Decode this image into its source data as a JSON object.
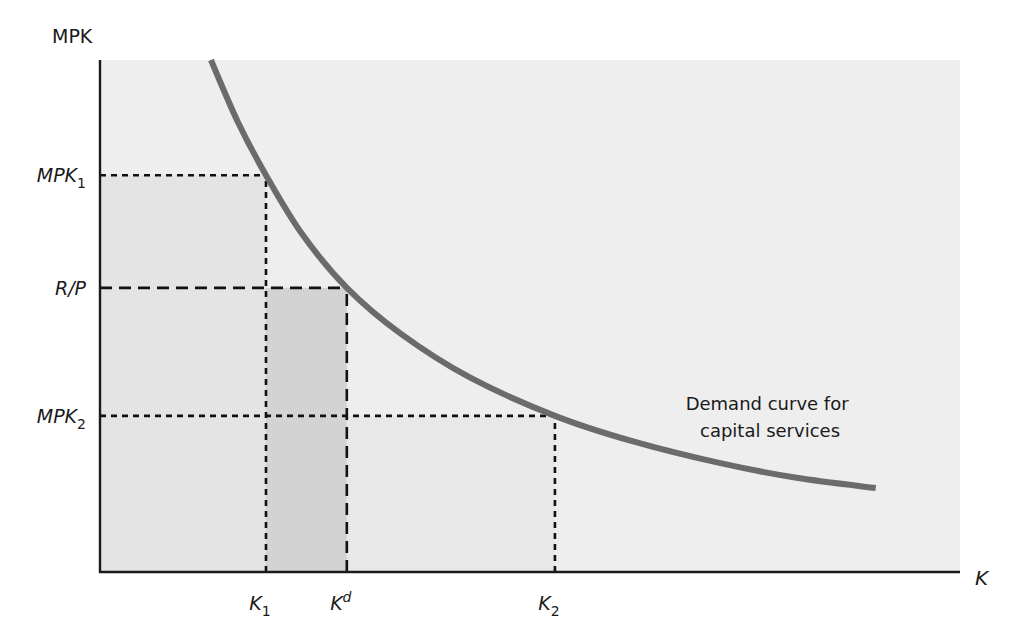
{
  "chart_data": {
    "type": "line",
    "title": "",
    "xlabel": "K",
    "ylabel": "MPK",
    "xlim": [
      0,
      100
    ],
    "ylim": [
      0,
      100
    ],
    "grid": false,
    "series": [
      {
        "name": "Demand curve for capital services",
        "label_lines": [
          "Demand curve for",
          "capital services"
        ],
        "color": "#6b6b6b",
        "points": [
          [
            12.9,
            100
          ],
          [
            16.0,
            88.0
          ],
          [
            19.3,
            77.5
          ],
          [
            23.5,
            66.0
          ],
          [
            28.7,
            55.5
          ],
          [
            35.0,
            46.5
          ],
          [
            43.0,
            38.0
          ],
          [
            52.9,
            30.5
          ],
          [
            62.0,
            25.5
          ],
          [
            72.0,
            21.3
          ],
          [
            81.0,
            18.4
          ],
          [
            90.2,
            16.4
          ]
        ]
      }
    ],
    "x_ticks": [
      {
        "name": "K1",
        "base": "K",
        "sub": "1",
        "sup": "",
        "value": 19.3
      },
      {
        "name": "Kd",
        "base": "K",
        "sub": "",
        "sup": "d",
        "value": 28.7
      },
      {
        "name": "K2",
        "base": "K",
        "sub": "2",
        "sup": "",
        "value": 52.9
      }
    ],
    "y_ticks": [
      {
        "name": "MPK1",
        "base": "MPK",
        "sub": "1",
        "value": 77.5
      },
      {
        "name": "R/P",
        "base": "R/P",
        "sub": "",
        "value": 55.5
      },
      {
        "name": "MPK2",
        "base": "MPK",
        "sub": "2",
        "value": 30.5
      }
    ],
    "reference_lines": [
      {
        "name": "mpk1-horizontal",
        "from": [
          0,
          77.5
        ],
        "to": [
          19.3,
          77.5
        ],
        "style": "dotted"
      },
      {
        "name": "k1-vertical",
        "from": [
          19.3,
          0
        ],
        "to": [
          19.3,
          77.5
        ],
        "style": "dotted"
      },
      {
        "name": "rp-horizontal",
        "from": [
          0,
          55.5
        ],
        "to": [
          28.7,
          55.5
        ],
        "style": "dashed"
      },
      {
        "name": "kd-vertical",
        "from": [
          28.7,
          0
        ],
        "to": [
          28.7,
          55.5
        ],
        "style": "dashed"
      },
      {
        "name": "mpk2-horizontal",
        "from": [
          0,
          30.5
        ],
        "to": [
          52.9,
          30.5
        ],
        "style": "dotted"
      },
      {
        "name": "k2-vertical",
        "from": [
          52.9,
          0
        ],
        "to": [
          52.9,
          30.5
        ],
        "style": "dotted"
      }
    ],
    "shaded_regions": [
      {
        "name": "region-k1",
        "x": [
          0,
          19.3
        ],
        "y": [
          0,
          77.5
        ],
        "color": "#e4e4e4"
      },
      {
        "name": "region-k1-kd",
        "x": [
          19.3,
          28.7
        ],
        "y": [
          0,
          55.5
        ],
        "color": "#d3d3d3"
      },
      {
        "name": "region-kd-k2",
        "x": [
          28.7,
          52.9
        ],
        "y": [
          0,
          30.5
        ],
        "color": "#e8e8e8"
      }
    ],
    "colors": {
      "plot_background": "#eeeeee",
      "axis": "#1a1a1a",
      "curve": "#6b6b6b",
      "ref_lines": "#111111"
    }
  }
}
